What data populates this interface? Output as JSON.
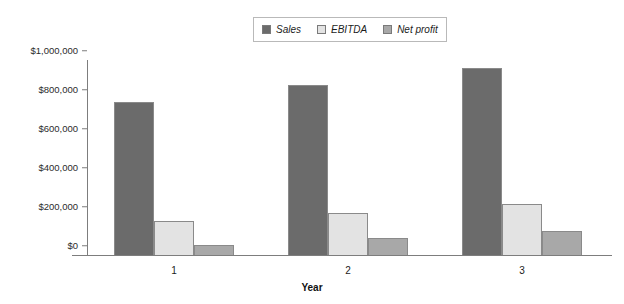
{
  "chart_data": {
    "type": "bar",
    "title": "",
    "subtitle": "",
    "xlabel": "Year",
    "ylabel": "",
    "categories": [
      "1",
      "2",
      "3"
    ],
    "series": [
      {
        "name": "Sales",
        "values": [
          785000,
          870000,
          960000
        ],
        "color": "#6b6b6b"
      },
      {
        "name": "EBITDA",
        "values": [
          175000,
          215000,
          260000
        ],
        "color": "#e3e3e3"
      },
      {
        "name": "Net profit",
        "values": [
          50000,
          87000,
          125000
        ],
        "color": "#a8a8a8"
      }
    ],
    "ylim": [
      0,
      1000000
    ],
    "yticks": [
      0,
      200000,
      400000,
      600000,
      800000,
      1000000
    ],
    "ytick_labels": [
      "$0",
      "$200,000",
      "$400,000",
      "$600,000",
      "$800,000",
      "$1,000,000"
    ],
    "grid": false,
    "legend_position": "top-center",
    "legend_italic": true
  },
  "axis": {
    "line_color": "#7d7d7d",
    "tick_color": "#7d7d7d",
    "text_color": "#2b2b2b"
  },
  "legend": {
    "border_color": "#b9b9b9",
    "background": "#ffffff"
  },
  "canvas": {
    "background": "#ffffff",
    "width": 624,
    "height": 304
  }
}
